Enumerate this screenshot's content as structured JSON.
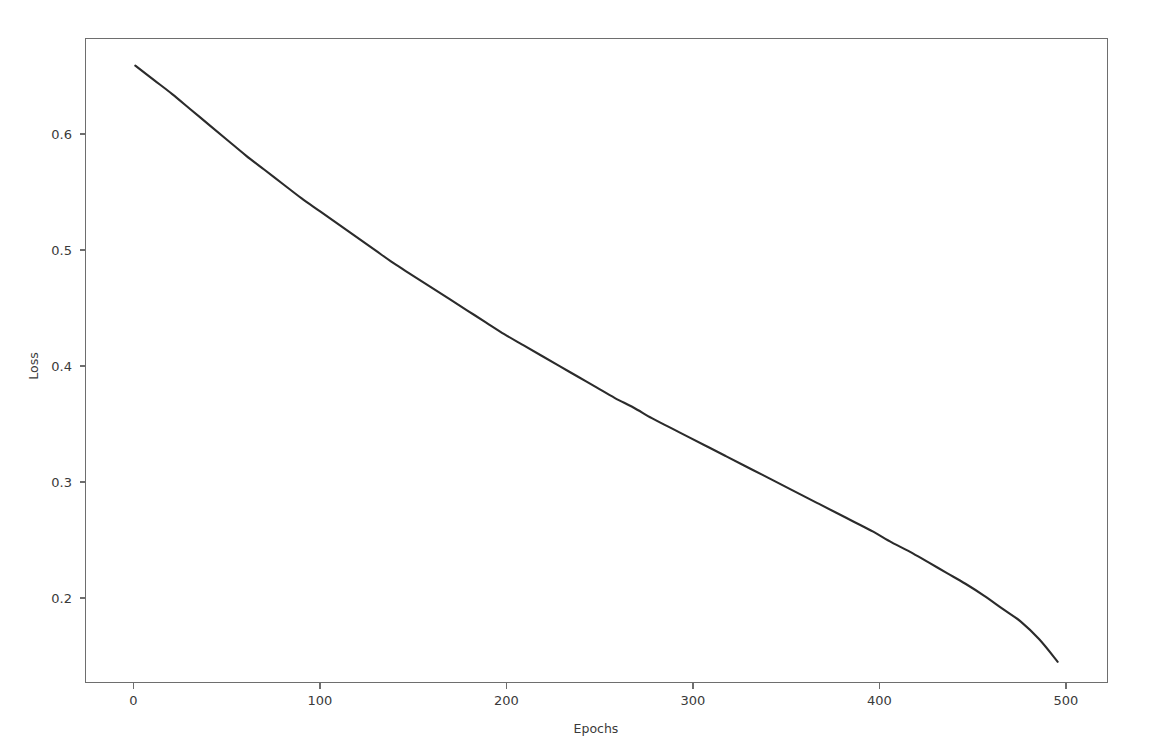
{
  "figure": {
    "background_color": "#ffffff",
    "width": 1153,
    "height": 750
  },
  "chart_data": {
    "type": "line",
    "title": "",
    "xlabel": "Epochs",
    "ylabel": "Loss",
    "xlim": [
      -27,
      527
    ],
    "ylim": [
      0.1355,
      0.68
    ],
    "grid": false,
    "legend": null,
    "xticks": [
      0,
      100,
      200,
      300,
      400,
      500
    ],
    "xtick_labels": [
      "0",
      "100",
      "200",
      "300",
      "400",
      "500"
    ],
    "yticks": [
      0.2,
      0.3,
      0.4,
      0.5,
      0.6
    ],
    "ytick_labels": [
      "0.2",
      "0.3",
      "0.4",
      "0.5",
      "0.6"
    ],
    "line_color": "#2b2b2b",
    "line_width": 2.1,
    "series": [
      {
        "name": "Loss",
        "x": [
          0,
          10,
          20,
          30,
          40,
          50,
          60,
          70,
          80,
          90,
          100,
          110,
          120,
          130,
          140,
          150,
          160,
          170,
          180,
          190,
          200,
          210,
          220,
          230,
          240,
          250,
          260,
          270,
          280,
          290,
          300,
          310,
          320,
          330,
          340,
          350,
          360,
          370,
          380,
          390,
          400,
          410,
          420,
          430,
          440,
          450,
          460,
          470,
          480,
          490,
          500
        ],
        "values": [
          0.657,
          0.645,
          0.633,
          0.62,
          0.607,
          0.594,
          0.581,
          0.569,
          0.557,
          0.545,
          0.534,
          0.523,
          0.512,
          0.501,
          0.49,
          0.48,
          0.47,
          0.46,
          0.45,
          0.44,
          0.43,
          0.421,
          0.412,
          0.403,
          0.394,
          0.385,
          0.376,
          0.368,
          0.359,
          0.351,
          0.343,
          0.335,
          0.327,
          0.319,
          0.311,
          0.303,
          0.295,
          0.287,
          0.279,
          0.271,
          0.263,
          0.254,
          0.246,
          0.237,
          0.228,
          0.219,
          0.209,
          0.198,
          0.187,
          0.172,
          0.153
        ]
      }
    ]
  },
  "axes": {
    "x_axis_name": "epochs-axis",
    "y_axis_name": "loss-axis"
  }
}
